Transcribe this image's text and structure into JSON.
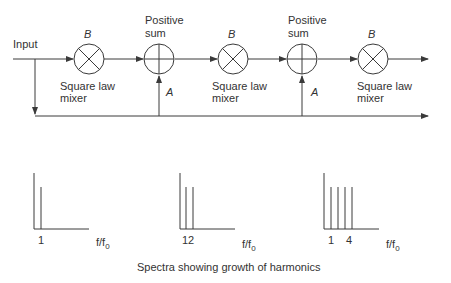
{
  "diagram": {
    "input_label": "Input",
    "mixers": [
      {
        "top_label": "B",
        "caption_line1": "Square law",
        "caption_line2": "mixer"
      },
      {
        "top_label": "B",
        "caption_line1": "Square law",
        "caption_line2": "mixer"
      },
      {
        "top_label": "B",
        "caption_line1": "Square law",
        "caption_line2": "mixer"
      }
    ],
    "sums": [
      {
        "top_line1": "Positive",
        "top_line2": "sum",
        "side_label": "A"
      },
      {
        "top_line1": "Positive",
        "top_line2": "sum",
        "side_label": "A"
      }
    ]
  },
  "spectra": {
    "caption": "Spectra showing growth of harmonics",
    "panels": [
      {
        "tick_label": "1",
        "axis_label_main": "f/f",
        "axis_label_sub": "0",
        "lines": 1
      },
      {
        "tick_label": "12",
        "axis_label_main": "f/f",
        "axis_label_sub": "0",
        "lines": 2
      },
      {
        "tick_label_left": "1",
        "tick_label_right": "4",
        "axis_label_main": "f/f",
        "axis_label_sub": "0",
        "lines": 4
      }
    ]
  },
  "colors": {
    "stroke": "#3a3a3a",
    "background": "#ffffff"
  }
}
